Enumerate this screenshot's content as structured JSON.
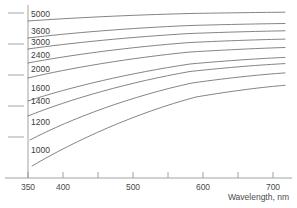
{
  "chart_data": {
    "type": "line",
    "title": "",
    "xlabel": "Wavelength, nm",
    "ylabel": "",
    "xlim": [
      350,
      730
    ],
    "ylim": [
      0,
      1
    ],
    "grid": false,
    "legend": "inline-curve-labels",
    "xticks": [
      {
        "value": 350,
        "label": "350",
        "x": 28
      },
      {
        "value": 400,
        "label": "400",
        "x": 63
      },
      {
        "value": 450,
        "label": "",
        "x": 98
      },
      {
        "value": 500,
        "label": "500",
        "x": 133
      },
      {
        "value": 550,
        "label": "",
        "x": 168
      },
      {
        "value": 600,
        "label": "600",
        "x": 203
      },
      {
        "value": 650,
        "label": "",
        "x": 238
      },
      {
        "value": 700,
        "label": "700",
        "x": 273
      }
    ],
    "yticks": [
      {
        "label": "",
        "y": 13
      },
      {
        "label": "",
        "y": 44
      },
      {
        "label": "",
        "y": 75
      },
      {
        "label": "",
        "y": 106
      },
      {
        "label": "",
        "y": 137
      }
    ],
    "series": [
      {
        "name": "5000",
        "label": "5000",
        "label_x": 31,
        "label_y": 17,
        "path": "M28,21 C70,18 130,15 190,13.5 C230,12.8 262,12.4 285,12.2"
      },
      {
        "name": "3600",
        "label": "3600",
        "label_x": 31,
        "label_y": 34,
        "path": "M28,38 C70,33 130,28 190,25.5 C230,24.4 262,23.8 285,23.5"
      },
      {
        "name": "3000",
        "label": "3000",
        "label_x": 31,
        "label_y": 45,
        "path": "M28,49 C70,43 130,37 190,33.5 C230,32.0 262,31.2 285,30.8"
      },
      {
        "name": "2400",
        "label": "2400",
        "label_x": 31,
        "label_y": 58,
        "path": "M28,63 C70,55 130,47 190,42.5 C230,40.6 262,39.6 285,39.1"
      },
      {
        "name": "2000",
        "label": "2000",
        "label_x": 31,
        "label_y": 72,
        "path": "M28,78 C70,68 130,58 190,52.0 C230,49.6 262,48.2 285,47.5"
      },
      {
        "name": "1600",
        "label": "1600",
        "label_x": 31,
        "label_y": 91,
        "path": "M28,101 C70,87 130,73 190,64.0 C230,60.4 262,58.4 285,57.4"
      },
      {
        "name": "1400",
        "label": "1400",
        "label_x": 31,
        "label_y": 104,
        "path": "M28,116 C70,99 130,82 190,71.5 C230,67.2 262,64.8 285,63.6"
      },
      {
        "name": "1200",
        "label": "1200",
        "label_x": 31,
        "label_y": 125,
        "path": "M30,140 C72,118 132,96 192,83.0 C232,77.4 263,74.4 285,72.9"
      },
      {
        "name": "1000",
        "label": "1000",
        "label_x": 31,
        "label_y": 153,
        "path": "M32,166 C76,140 136,113 196,97.0 C234,90.6 264,87.0 285,85.3"
      }
    ]
  },
  "colors": {
    "curve": "#6e6e6e",
    "axis": "#8c8c8c",
    "text": "#4a4a4a",
    "background": "#ffffff"
  }
}
